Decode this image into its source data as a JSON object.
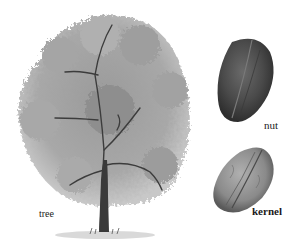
{
  "illustration": {
    "subject": "pecan",
    "labels": {
      "tree": "tree",
      "nut": "nut",
      "kernel": "kernel"
    },
    "colors": {
      "foliage": "#8c8c8c",
      "foliage_light": "#b5b5b5",
      "trunk": "#3a3a3a",
      "nut_shell": "#4a4a4a",
      "kernel": "#8a8a8a",
      "background": "#ffffff"
    }
  }
}
